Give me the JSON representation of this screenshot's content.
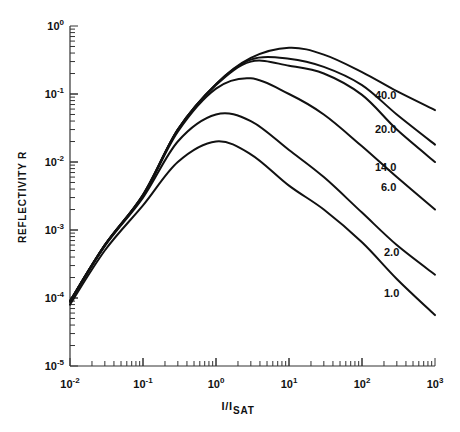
{
  "chart_data": {
    "type": "line",
    "title": "",
    "xlabel": "I/I_SAT",
    "xlabel_main": "I/I",
    "xlabel_sub": "SAT",
    "ylabel": "REFLECTIVITY R",
    "xscale": "log",
    "yscale": "log",
    "xlim": [
      0.01,
      1000
    ],
    "ylim": [
      1e-05,
      1
    ],
    "grid": false,
    "legend": "inline labels at right end of each curve",
    "x_ticks": [
      {
        "base": "10",
        "exp": "-2"
      },
      {
        "base": "10",
        "exp": "-1"
      },
      {
        "base": "10",
        "exp": "0"
      },
      {
        "base": "10",
        "exp": "1"
      },
      {
        "base": "10",
        "exp": "2"
      },
      {
        "base": "10",
        "exp": "3"
      }
    ],
    "y_ticks": [
      {
        "base": "10",
        "exp": "0"
      },
      {
        "base": "10",
        "exp": "-1"
      },
      {
        "base": "10",
        "exp": "-2"
      },
      {
        "base": "10",
        "exp": "-3"
      },
      {
        "base": "10",
        "exp": "-4"
      },
      {
        "base": "10",
        "exp": "-5"
      }
    ],
    "x": [
      0.01,
      0.03,
      0.1,
      0.3,
      1,
      3,
      10,
      30,
      100,
      300,
      1000
    ],
    "series": [
      {
        "name": "40.0",
        "label_pos": [
          375,
          99
        ],
        "values": [
          9e-05,
          0.0006,
          0.0033,
          0.03,
          0.14,
          0.34,
          0.48,
          0.38,
          0.21,
          0.11,
          0.058
        ]
      },
      {
        "name": "20.0",
        "label_pos": [
          375,
          133
        ],
        "values": [
          9e-05,
          0.0006,
          0.0033,
          0.03,
          0.14,
          0.32,
          0.33,
          0.25,
          0.135,
          0.05,
          0.018
        ]
      },
      {
        "name": "14.0",
        "label_pos": [
          375,
          171
        ],
        "values": [
          9e-05,
          0.0006,
          0.0032,
          0.03,
          0.135,
          0.3,
          0.26,
          0.2,
          0.097,
          0.03,
          0.01
        ]
      },
      {
        "name": "6.0",
        "label_pos": [
          381,
          191
        ],
        "values": [
          9e-05,
          0.0006,
          0.0032,
          0.028,
          0.12,
          0.17,
          0.1,
          0.05,
          0.017,
          0.006,
          0.002
        ]
      },
      {
        "name": "2.0",
        "label_pos": [
          384,
          256
        ],
        "values": [
          8.8e-05,
          0.00058,
          0.003,
          0.02,
          0.05,
          0.04,
          0.015,
          0.006,
          0.0018,
          0.0006,
          0.00022
        ]
      },
      {
        "name": "1.0",
        "label_pos": [
          384,
          297
        ],
        "values": [
          8e-05,
          0.0005,
          0.0023,
          0.01,
          0.02,
          0.013,
          0.0045,
          0.002,
          0.00066,
          0.00019,
          5.6e-05
        ]
      }
    ]
  },
  "plot_area": {
    "x0": 70,
    "x1": 435,
    "y_top": 26,
    "y_bottom": 366
  },
  "colors": {
    "line": "#111111",
    "axis": "#333333",
    "background": "#ffffff"
  }
}
